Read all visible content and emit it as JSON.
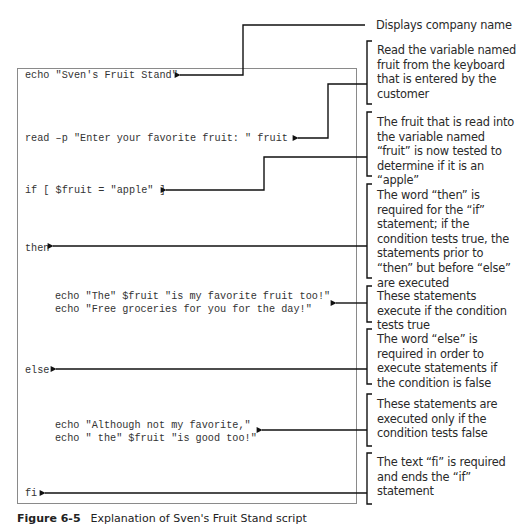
{
  "figure": {
    "caption_label": "Figure 6-5",
    "caption_text": "Explanation of Sven's Fruit Stand script"
  },
  "code_lines": [
    {
      "id": "echo-company",
      "text": "echo \"Sven's Fruit Stand\""
    },
    {
      "id": "read-fruit",
      "text": "read –p \"Enter your favorite fruit: \" fruit"
    },
    {
      "id": "if-test",
      "text": "if [ $fruit = \"apple\" ]"
    },
    {
      "id": "then",
      "text": "then"
    },
    {
      "id": "echo-true-1",
      "text": "echo \"The\" $fruit \"is my favorite fruit too!\""
    },
    {
      "id": "echo-true-2",
      "text": "echo \"Free groceries for you for the day!\""
    },
    {
      "id": "else",
      "text": "else"
    },
    {
      "id": "echo-false-1",
      "text": "echo \"Although not my favorite,\""
    },
    {
      "id": "echo-false-2",
      "text": "echo \" the\" $fruit \"is good too!\""
    },
    {
      "id": "fi",
      "text": "fi"
    }
  ],
  "annotations": [
    {
      "id": "company-name",
      "text": "Displays company name"
    },
    {
      "id": "read-variable",
      "text": "Read the variable named fruit from the keyboard that is entered by the customer"
    },
    {
      "id": "test-apple",
      "text": "The fruit that is read into the variable named “fruit” is now tested to determine if it is an “apple”"
    },
    {
      "id": "then-word",
      "text": "The word “then” is required for the “if” statement; if the condition tests true, the statements prior to “then” but before “else” are executed"
    },
    {
      "id": "true-statements",
      "text": "These statements execute if the condition tests true"
    },
    {
      "id": "else-word",
      "text": "The word “else” is required in order to execute statements if the condition is false"
    },
    {
      "id": "false-statements",
      "text": "These statements are executed only if the condition tests false"
    },
    {
      "id": "fi-word",
      "text": "The text “fi” is required and ends the “if” statement"
    }
  ],
  "colors": {
    "line": "#111111",
    "box_border": "#8a8a8a",
    "code_text": "#333333",
    "note_text": "#2a2a2a"
  }
}
